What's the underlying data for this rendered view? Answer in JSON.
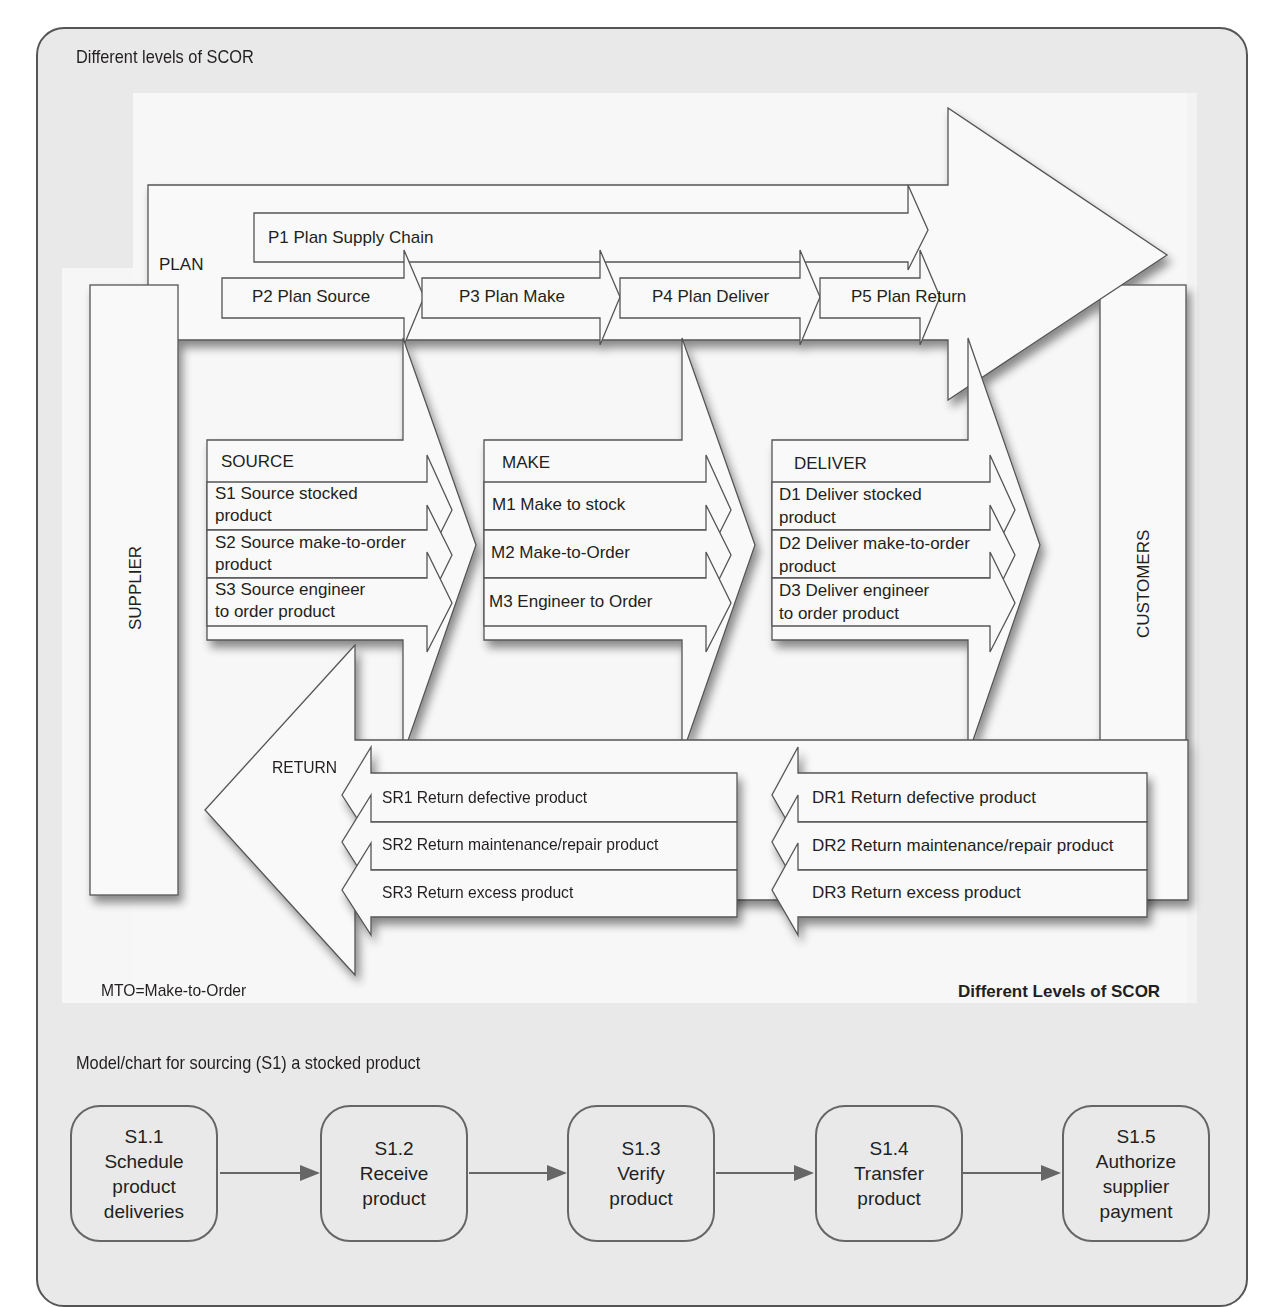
{
  "panel": {
    "title": "Different levels of SCOR",
    "subtitle": "Model/chart for sourcing (S1) a stocked product"
  },
  "diagram": {
    "caption": "Different Levels of SCOR",
    "footnote": "MTO=Make-to-Order",
    "supplier_label": "SUPPLIER",
    "customers_label": "CUSTOMERS",
    "plan": {
      "label": "PLAN",
      "p1": "P1 Plan Supply Chain",
      "items": [
        "P2 Plan Source",
        "P3 Plan Make",
        "P4 Plan Deliver",
        "P5 Plan Return"
      ]
    },
    "source": {
      "label": "SOURCE",
      "items": [
        [
          "S1 Source stocked",
          "product"
        ],
        [
          "S2 Source make-to-order",
          "product"
        ],
        [
          "S3 Source engineer",
          "to order product"
        ]
      ]
    },
    "make": {
      "label": "MAKE",
      "items": [
        "M1 Make to stock",
        "M2 Make-to-Order",
        "M3 Engineer to Order"
      ]
    },
    "deliver": {
      "label": "DELIVER",
      "items": [
        [
          "D1 Deliver stocked",
          "product"
        ],
        [
          "D2 Deliver make-to-order",
          "product"
        ],
        [
          "D3 Deliver engineer",
          "to order product"
        ]
      ]
    },
    "return": {
      "label": "RETURN",
      "source_returns": [
        "SR1 Return defective product",
        "SR2 Return maintenance/repair product",
        "SR3 Return excess product"
      ],
      "deliver_returns": [
        "DR1 Return defective product",
        "DR2 Return maintenance/repair product",
        "DR3 Return excess product"
      ]
    }
  },
  "flow": {
    "steps": [
      {
        "id": "S1.1",
        "lines": [
          "Schedule",
          "product",
          "deliveries"
        ]
      },
      {
        "id": "S1.2",
        "lines": [
          "Receive",
          "product"
        ]
      },
      {
        "id": "S1.3",
        "lines": [
          "Verify",
          "product"
        ]
      },
      {
        "id": "S1.4",
        "lines": [
          "Transfer",
          "product"
        ]
      },
      {
        "id": "S1.5",
        "lines": [
          "Authorize",
          "supplier",
          "payment"
        ]
      }
    ]
  },
  "colors": {
    "panel_bg": "#e9e9e9",
    "shape_fill": "#f9f9f9",
    "stroke": "#555555",
    "text": "#231f20"
  }
}
